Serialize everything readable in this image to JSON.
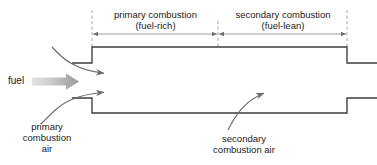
{
  "diagram": {
    "title_zones": {
      "primary": "primary combustion\n(fuel-rich)",
      "secondary": "secondary combustion\n(fuel-lean)"
    },
    "labels": {
      "fuel": "fuel",
      "primary_air": "primary\ncombustion\nair",
      "secondary_air": "secondary\ncombustion air"
    },
    "colors": {
      "duct_wall": "#3c3c3c",
      "dimension_line": "#8c8c8c",
      "dashed_guide": "#9a9a9a",
      "flow_arrow": "#6b6b6b",
      "fuel_arrow_light": "#d8d8d8",
      "fuel_arrow_dark": "#9e9e9e",
      "text": "#1a1a1a",
      "background": "#ffffff"
    },
    "geometry": {
      "duct_inlet_left_x": 72,
      "duct_step_x": 92,
      "duct_exit_x": 347,
      "duct_right_edge_x": 377,
      "top_wall_inlet_y": 63,
      "top_wall_main_y": 47,
      "bottom_wall_inlet_y": 98,
      "bottom_wall_main_y": 113,
      "dimension_line_y": 34,
      "zone_divider_x": 218
    }
  }
}
